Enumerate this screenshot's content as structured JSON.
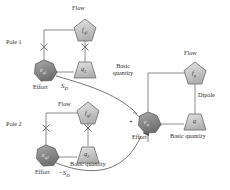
{
  "figure": {
    "type": "diagram",
    "title_visible": false,
    "colors": {
      "line": "#6e6e6e",
      "node_fill_light": "#cfcfcf",
      "node_fill_dark": "#8f8f8f",
      "text": "#2b2b2b",
      "background": "#ffffff"
    }
  },
  "labels": {
    "pole1": "Pole 1",
    "pole2": "Pole 2",
    "dipole": "Dipole",
    "flow": "Flow",
    "effort": "Effort",
    "basic_quantity": "Basic quantity",
    "basic_quantity_wrapped": "Basic quantity",
    "entropy_pos": "S",
    "entropy_pos_sub": "D",
    "entropy_neg": "−S",
    "entropy_neg_sub": "D",
    "plus_sign": "+"
  },
  "nodes": [
    {
      "id": "f_q1",
      "kind": "pentagon",
      "shade": "light",
      "label": "f",
      "sub": "q1",
      "group": "pole1",
      "cx": 85,
      "cy": 30
    },
    {
      "id": "q_1",
      "kind": "trapezoid",
      "shade": "light",
      "label": "q",
      "sub": "1",
      "group": "pole1",
      "cx": 85,
      "cy": 70
    },
    {
      "id": "e_q1",
      "kind": "heptagon",
      "shade": "dark",
      "label": "e",
      "sub": "q1",
      "group": "pole1",
      "cx": 44,
      "cy": 70
    },
    {
      "id": "f_q2",
      "kind": "pentagon",
      "shade": "light",
      "label": "f",
      "sub": "q2",
      "group": "pole2",
      "cx": 88,
      "cy": 113
    },
    {
      "id": "q_2",
      "kind": "trapezoid",
      "shade": "light",
      "label": "q",
      "sub": "2",
      "group": "pole2",
      "cx": 88,
      "cy": 155
    },
    {
      "id": "e_q2",
      "kind": "heptagon",
      "shade": "dark",
      "label": "e",
      "sub": "q2",
      "group": "pole2",
      "cx": 46,
      "cy": 155
    },
    {
      "id": "f_q",
      "kind": "pentagon",
      "shade": "light",
      "label": "f",
      "sub": "q",
      "group": "dipole",
      "cx": 195,
      "cy": 73
    },
    {
      "id": "q",
      "kind": "trapezoid",
      "shade": "light",
      "label": "q",
      "sub": "",
      "group": "dipole",
      "cx": 195,
      "cy": 122
    },
    {
      "id": "e_q",
      "kind": "heptagon",
      "shade": "dark",
      "label": "e",
      "sub": "q",
      "group": "dipole",
      "cx": 148,
      "cy": 122
    }
  ],
  "junction_markers": [
    {
      "id": "x-pole1-left",
      "x": 44,
      "y": 47
    },
    {
      "id": "x-pole1-right",
      "x": 85,
      "y": 47
    },
    {
      "id": "x-pole2-left",
      "x": 46,
      "y": 128
    },
    {
      "id": "x-pole2-right",
      "x": 88,
      "y": 128
    }
  ],
  "label_positions": {
    "flow_pole1": {
      "x": 72,
      "y": 7
    },
    "flow_pole2": {
      "x": 59,
      "y": 102
    },
    "flow_dipole": {
      "x": 185,
      "y": 52
    },
    "pole1": {
      "x": 6,
      "y": 41
    },
    "pole2": {
      "x": 6,
      "y": 123
    },
    "dipole": {
      "x": 199,
      "y": 94
    },
    "effort_pole1": {
      "x": 35,
      "y": 85
    },
    "effort_pole2": {
      "x": 37,
      "y": 170
    },
    "effort_dipole": {
      "x": 134,
      "y": 135
    },
    "bq_pole1": {
      "x": 110,
      "y": 66
    },
    "bq_pole2": {
      "x": 72,
      "y": 164
    },
    "bq_dipole": {
      "x": 173,
      "y": 135
    },
    "entropy_pos": {
      "x": 62,
      "y": 85
    },
    "entropy_neg": {
      "x": 60,
      "y": 172
    },
    "plus": {
      "x": 131,
      "y": 122
    }
  }
}
